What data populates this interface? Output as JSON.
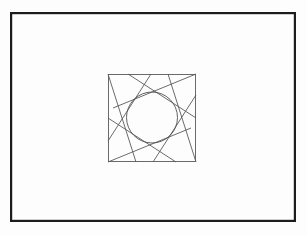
{
  "canvas": {
    "width": 307,
    "height": 236,
    "background_color": "#fdfdfd"
  },
  "outer_frame": {
    "label": "outer-rectangle-border",
    "x": 10,
    "y": 12,
    "width": 286,
    "height": 210,
    "stroke_color": "#1c1c1c",
    "stroke_width": 2.2,
    "fill": "none"
  },
  "inner_square": {
    "label": "inner-square",
    "x": 108,
    "y": 74,
    "width": 88,
    "height": 88,
    "stroke_color": "#5a5a5a",
    "stroke_width": 0.9,
    "fill": "none"
  },
  "circle": {
    "label": "inscribed-circle",
    "cx": 152,
    "cy": 117.5,
    "r": 25.5,
    "stroke_color": "#4f4f4f",
    "stroke_width": 0.9,
    "fill": "none"
  },
  "tangent_lines": {
    "label": "pinwheel-tangent-lines",
    "stroke_color": "#5a5a5a",
    "stroke_width": 0.9,
    "count": 8,
    "segments": [
      {
        "name": "line-top-left-corner-down",
        "x1": 108,
        "y1": 74,
        "x2": 136,
        "y2": 162
      },
      {
        "name": "line-top-edge-sweep-left",
        "x1": 151,
        "y1": 74,
        "x2": 108,
        "y2": 141
      },
      {
        "name": "line-top-right-corner-long-left",
        "x1": 196,
        "y1": 74,
        "x2": 113,
        "y2": 108
      },
      {
        "name": "line-right-edge-sweep-up",
        "x1": 196,
        "y1": 118,
        "x2": 128,
        "y2": 74
      },
      {
        "name": "line-bottom-right-corner-up",
        "x1": 196,
        "y1": 162,
        "x2": 168,
        "y2": 74
      },
      {
        "name": "line-bottom-edge-sweep-right",
        "x1": 153,
        "y1": 162,
        "x2": 196,
        "y2": 95
      },
      {
        "name": "line-bottom-left-corner-long-right",
        "x1": 108,
        "y1": 162,
        "x2": 191,
        "y2": 128
      },
      {
        "name": "line-left-edge-sweep-down",
        "x1": 108,
        "y1": 118,
        "x2": 176,
        "y2": 162
      }
    ]
  }
}
